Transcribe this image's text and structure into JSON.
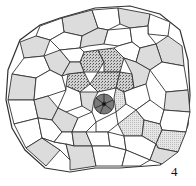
{
  "figure": {
    "label": "4",
    "colors": {
      "outline": "#333333",
      "light_cell": "#dcdcdc",
      "white_cell": "#ffffff",
      "stippled_cell": "#b8b8b8",
      "dark_cell": "#7a7a7a",
      "center_dot": "#111111"
    }
  }
}
